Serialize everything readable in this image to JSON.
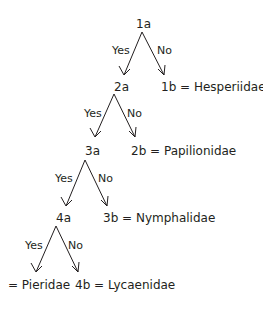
{
  "diagram": {
    "type": "dichotomous-key",
    "nodes": {
      "n1a": "1a",
      "n2a": "2a",
      "n3a": "3a",
      "n4a": "4a"
    },
    "leaves": {
      "l1b": "1b = Hesperiidae",
      "l2b": "2b = Papilionidae",
      "l3b": "3b = Nymphalidae",
      "l4b": "4b = Lycaenidae",
      "l4c": "= Pieridae"
    },
    "edges": {
      "yes": "Yes",
      "no": "No"
    },
    "colors": {
      "ink": "#231f20",
      "background": "#ffffff"
    }
  }
}
